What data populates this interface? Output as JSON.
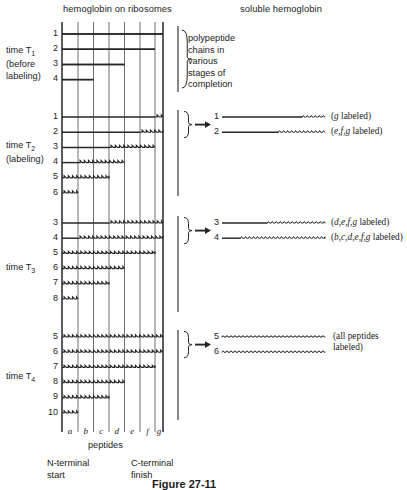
{
  "figure": {
    "caption": "Figure 27-11",
    "headers": {
      "left": "hemoglobin on ribosomes",
      "right": "soluble hemoglobin"
    },
    "axis": {
      "peptides_label": "peptides",
      "n_terminal_line1": "N-terminal",
      "n_terminal_line2": "start",
      "c_terminal_line1": "C-terminal",
      "c_terminal_line2": "finish",
      "peptide_letters": [
        "a",
        "b",
        "c",
        "d",
        "e",
        "f",
        "g"
      ]
    },
    "t1_brace_note_lines": [
      "polypeptide",
      "chains in",
      "various",
      "stages of",
      "completion"
    ],
    "timepoints": [
      {
        "id": "T1",
        "label_lines": [
          "time T₁",
          "(before",
          "labeling)"
        ],
        "label_main": "time T",
        "label_sub": "1",
        "label_extra": [
          "(before",
          "labeling)"
        ],
        "chains": [
          {
            "num": "1",
            "plain_end": 7,
            "wavy_start": 7,
            "wavy_end": 7
          },
          {
            "num": "2",
            "plain_end": 6,
            "wavy_start": 6,
            "wavy_end": 6
          },
          {
            "num": "3",
            "plain_end": 4,
            "wavy_start": 4,
            "wavy_end": 4
          },
          {
            "num": "4",
            "plain_end": 2,
            "wavy_start": 2,
            "wavy_end": 2
          }
        ],
        "products": []
      },
      {
        "id": "T2",
        "label_main": "time T",
        "label_sub": "2",
        "label_extra": [
          "(labeling)"
        ],
        "chains": [
          {
            "num": "1",
            "plain_end": 6,
            "wavy_start": 6,
            "wavy_end": 7
          },
          {
            "num": "2",
            "plain_end": 5,
            "wavy_start": 5,
            "wavy_end": 7
          },
          {
            "num": "3",
            "plain_end": 3,
            "wavy_start": 3,
            "wavy_end": 6
          },
          {
            "num": "4",
            "plain_end": 1,
            "wavy_start": 1,
            "wavy_end": 4
          },
          {
            "num": "5",
            "plain_end": 0,
            "wavy_start": 0,
            "wavy_end": 3
          },
          {
            "num": "6",
            "plain_end": 0,
            "wavy_start": 0,
            "wavy_end": 1
          }
        ],
        "products": [
          {
            "num": "1",
            "wavy_frac": 0.78,
            "note_prefix": "(",
            "note_italic": "g",
            "note_suffix": " labeled)"
          },
          {
            "num": "2",
            "wavy_frac": 0.55,
            "note_prefix": "(",
            "note_italic": "e,f,g",
            "note_suffix": " labeled)"
          }
        ]
      },
      {
        "id": "T3",
        "label_main": "time T",
        "label_sub": "3",
        "label_extra": [],
        "chains": [
          {
            "num": "3",
            "plain_end": 3,
            "wavy_start": 3,
            "wavy_end": 7
          },
          {
            "num": "4",
            "plain_end": 1,
            "wavy_start": 1,
            "wavy_end": 7
          },
          {
            "num": "5",
            "plain_end": 0,
            "wavy_start": 0,
            "wavy_end": 6
          },
          {
            "num": "6",
            "plain_end": 0,
            "wavy_start": 0,
            "wavy_end": 4
          },
          {
            "num": "7",
            "plain_end": 0,
            "wavy_start": 0,
            "wavy_end": 3
          },
          {
            "num": "8",
            "plain_end": 0,
            "wavy_start": 0,
            "wavy_end": 1
          }
        ],
        "products": [
          {
            "num": "3",
            "wavy_frac": 0.44,
            "note_prefix": "(",
            "note_italic": "d,e,f,g",
            "note_suffix": " labeled)"
          },
          {
            "num": "4",
            "wavy_frac": 0.18,
            "note_prefix": "(",
            "note_italic": "b,c,d,e,f,g",
            "note_suffix": " labeled)"
          }
        ]
      },
      {
        "id": "T4",
        "label_main": "time T",
        "label_sub": "4",
        "label_extra": [],
        "chains": [
          {
            "num": "5",
            "plain_end": 0,
            "wavy_start": 0,
            "wavy_end": 7
          },
          {
            "num": "6",
            "plain_end": 0,
            "wavy_start": 0,
            "wavy_end": 7
          },
          {
            "num": "7",
            "plain_end": 0,
            "wavy_start": 0,
            "wavy_end": 6
          },
          {
            "num": "8",
            "plain_end": 0,
            "wavy_start": 0,
            "wavy_end": 4
          },
          {
            "num": "9",
            "plain_end": 0,
            "wavy_start": 0,
            "wavy_end": 3
          },
          {
            "num": "10",
            "plain_end": 0,
            "wavy_start": 0,
            "wavy_end": 1
          }
        ],
        "products": [
          {
            "num": "5",
            "wavy_frac": 0.0,
            "note_prefix": "",
            "note_italic": "",
            "note_suffix": ""
          },
          {
            "num": "6",
            "wavy_frac": 0.0,
            "note_prefix": "",
            "note_italic": "",
            "note_suffix": ""
          }
        ],
        "product_note_lines": [
          "(all peptides",
          "labeled)"
        ]
      }
    ]
  }
}
